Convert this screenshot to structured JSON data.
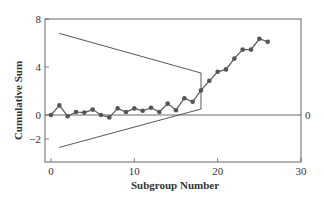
{
  "chart_data": {
    "type": "line",
    "title": "",
    "xlabel": "Subgroup Number",
    "ylabel": "Cumulative Sum",
    "xlim": [
      -0.5,
      30
    ],
    "ylim": [
      -2,
      8
    ],
    "x_ticks": [
      0,
      10,
      20,
      30
    ],
    "y_ticks": [
      -2,
      0,
      4,
      8
    ],
    "x_tick_labels": [
      "0",
      "10",
      "20",
      "30"
    ],
    "y_tick_labels": [
      "−2",
      "0",
      "4",
      "8"
    ],
    "grid": false,
    "right_axis_label": "0",
    "center_line": 0,
    "series": [
      {
        "name": "Cumulative Sum",
        "x": [
          0,
          1,
          2,
          3,
          4,
          5,
          6,
          7,
          8,
          9,
          10,
          11,
          12,
          13,
          14,
          15,
          16,
          17,
          18,
          19,
          20,
          21,
          22,
          23,
          24,
          25,
          26
        ],
        "values": [
          0,
          0.8,
          -0.1,
          0.25,
          0.2,
          0.45,
          0,
          -0.2,
          0.55,
          0.25,
          0.55,
          0.35,
          0.6,
          0.25,
          0.95,
          0.4,
          1.4,
          1.1,
          2.05,
          2.85,
          3.6,
          3.8,
          4.7,
          5.45,
          5.45,
          6.35,
          6.1
        ]
      }
    ],
    "v_mask": {
      "apex_x": 18,
      "start_x": 1,
      "upper": [
        [
          1,
          6.8
        ],
        [
          18,
          3.5
        ]
      ],
      "lower": [
        [
          1,
          -2.7
        ],
        [
          18,
          0.5
        ]
      ]
    }
  }
}
